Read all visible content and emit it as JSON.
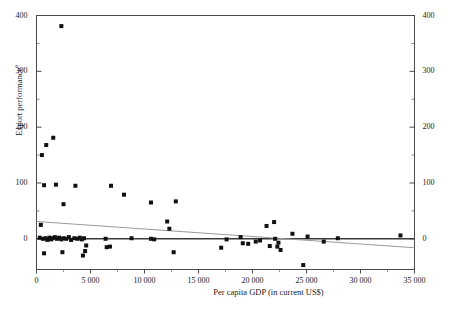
{
  "chart_data": {
    "type": "scatter",
    "title": "",
    "xlabel": "Per capita GDP (in current US$)",
    "ylabel": "Export performance",
    "ylabel_superscript": "a",
    "xlim": [
      0,
      35000
    ],
    "ylim": [
      -55,
      400
    ],
    "grid": false,
    "legend": null,
    "xticks": [
      0,
      5000,
      10000,
      15000,
      20000,
      25000,
      30000,
      35000
    ],
    "xticklabels": [
      "0",
      "5 000",
      "10 000",
      "15 000",
      "20 000",
      "25 000",
      "30 000",
      "35 000"
    ],
    "yticks": [
      0,
      100,
      200,
      300,
      400
    ],
    "yticklabels": [
      "0",
      "100",
      "200",
      "300",
      "400"
    ],
    "yticks_right": [
      0,
      100,
      200,
      300,
      400
    ],
    "yticklabels_right": [
      "0",
      "100",
      "200",
      "300",
      "400"
    ],
    "minor_yticks": [
      50,
      150,
      250,
      350
    ],
    "marker": "square",
    "marker_color": "#111111",
    "marker_size": 4,
    "points": [
      {
        "x": 2300,
        "y": 381
      },
      {
        "x": 1550,
        "y": 181
      },
      {
        "x": 900,
        "y": 168
      },
      {
        "x": 500,
        "y": 150
      },
      {
        "x": 700,
        "y": 96
      },
      {
        "x": 1800,
        "y": 97
      },
      {
        "x": 3600,
        "y": 95
      },
      {
        "x": 2500,
        "y": 62
      },
      {
        "x": 6900,
        "y": 95
      },
      {
        "x": 8100,
        "y": 79
      },
      {
        "x": 10600,
        "y": 65
      },
      {
        "x": 12900,
        "y": 67
      },
      {
        "x": 12100,
        "y": 31
      },
      {
        "x": 12300,
        "y": 18
      },
      {
        "x": 400,
        "y": 25
      },
      {
        "x": 300,
        "y": 2
      },
      {
        "x": 600,
        "y": 0
      },
      {
        "x": 850,
        "y": 1
      },
      {
        "x": 1000,
        "y": -2
      },
      {
        "x": 1200,
        "y": 2
      },
      {
        "x": 1350,
        "y": -1
      },
      {
        "x": 1500,
        "y": 1
      },
      {
        "x": 1700,
        "y": 3
      },
      {
        "x": 1900,
        "y": 0
      },
      {
        "x": 2100,
        "y": 2
      },
      {
        "x": 2300,
        "y": -1
      },
      {
        "x": 2500,
        "y": 1
      },
      {
        "x": 2750,
        "y": 0
      },
      {
        "x": 3000,
        "y": 3
      },
      {
        "x": 3200,
        "y": -2
      },
      {
        "x": 3500,
        "y": 1
      },
      {
        "x": 3800,
        "y": 0
      },
      {
        "x": 4000,
        "y": 2
      },
      {
        "x": 4200,
        "y": -1
      },
      {
        "x": 4400,
        "y": 1
      },
      {
        "x": 4600,
        "y": -12
      },
      {
        "x": 4500,
        "y": -22
      },
      {
        "x": 4300,
        "y": -30
      },
      {
        "x": 700,
        "y": -26
      },
      {
        "x": 2400,
        "y": -24
      },
      {
        "x": 6400,
        "y": 0
      },
      {
        "x": 8800,
        "y": 1
      },
      {
        "x": 10600,
        "y": 0
      },
      {
        "x": 10900,
        "y": -1
      },
      {
        "x": 6500,
        "y": -15
      },
      {
        "x": 6800,
        "y": -14
      },
      {
        "x": 12700,
        "y": -24
      },
      {
        "x": 17100,
        "y": -16
      },
      {
        "x": 17600,
        "y": -1
      },
      {
        "x": 18900,
        "y": 3
      },
      {
        "x": 19100,
        "y": -8
      },
      {
        "x": 19600,
        "y": -9
      },
      {
        "x": 20300,
        "y": -5
      },
      {
        "x": 20700,
        "y": -3
      },
      {
        "x": 21300,
        "y": 23
      },
      {
        "x": 21600,
        "y": -13
      },
      {
        "x": 22100,
        "y": 0
      },
      {
        "x": 22400,
        "y": -7
      },
      {
        "x": 22000,
        "y": 30
      },
      {
        "x": 22300,
        "y": -14
      },
      {
        "x": 22600,
        "y": -20
      },
      {
        "x": 23700,
        "y": 9
      },
      {
        "x": 25100,
        "y": 4
      },
      {
        "x": 26600,
        "y": -5
      },
      {
        "x": 27900,
        "y": 1
      },
      {
        "x": 33700,
        "y": 6
      },
      {
        "x": 24700,
        "y": -47
      }
    ],
    "lines": [
      {
        "name": "zero-line",
        "color": "#3a3a3a",
        "width": 1.4,
        "x": [
          0,
          35000
        ],
        "y": [
          0,
          0
        ]
      },
      {
        "name": "trend-line",
        "color": "#9a9a9a",
        "width": 1.1,
        "x": [
          0,
          35000
        ],
        "y": [
          31,
          -16
        ]
      }
    ]
  }
}
